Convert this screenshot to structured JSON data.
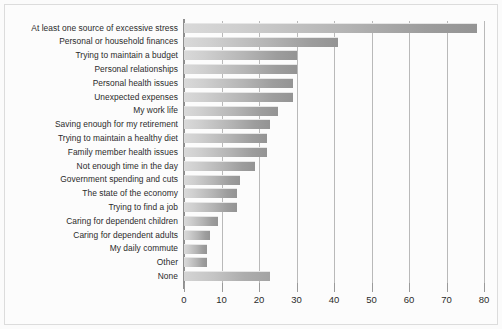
{
  "chart_data": {
    "type": "bar",
    "orientation": "horizontal",
    "title": "",
    "subtitle": "",
    "xlabel": "",
    "ylabel": "",
    "xlim": [
      0,
      80
    ],
    "xticks": [
      0,
      10,
      20,
      30,
      40,
      50,
      60,
      70,
      80
    ],
    "grid": "vertical",
    "legend": "none",
    "categories": [
      "At least one source of excessive stress",
      "Personal or household finances",
      "Trying to maintain a budget",
      "Personal relationships",
      "Personal health issues",
      "Unexpected expenses",
      "My work life",
      "Saving enough for my retirement",
      "Trying to maintain a healthy diet",
      "Family member health issues",
      "Not enough time in the day",
      "Government spending and cuts",
      "The state of the economy",
      "Trying to find a job",
      "Caring for dependent children",
      "Caring for dependent adults",
      "My daily commute",
      "Other",
      "None"
    ],
    "values": [
      78,
      41,
      30,
      30,
      29,
      29,
      25,
      23,
      22,
      22,
      19,
      15,
      14,
      14,
      9,
      7,
      6,
      6,
      23
    ],
    "bar_color": "#b4b4b4",
    "grid_color": "#b9b9b9",
    "axis_color": "#8f8f8f",
    "text_color": "#2b2b2b",
    "background": "#fcfcfc"
  }
}
